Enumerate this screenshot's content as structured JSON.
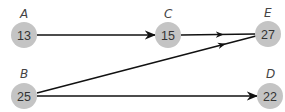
{
  "diagram": {
    "type": "directed-graph",
    "node_fill": "#c4c4c4",
    "edge_color": "#111111",
    "nodes": [
      {
        "id": "A",
        "label": "A",
        "value": "13",
        "x": 24,
        "y": 35
      },
      {
        "id": "C",
        "label": "C",
        "value": "15",
        "x": 168,
        "y": 35
      },
      {
        "id": "E",
        "label": "E",
        "value": "27",
        "x": 268,
        "y": 34
      },
      {
        "id": "B",
        "label": "B",
        "value": "25",
        "x": 24,
        "y": 96
      },
      {
        "id": "D",
        "label": "D",
        "value": "22",
        "x": 270,
        "y": 96
      }
    ],
    "edges": [
      {
        "from": "A",
        "to": "C"
      },
      {
        "from": "C",
        "to": "E"
      },
      {
        "from": "B",
        "to": "E"
      },
      {
        "from": "B",
        "to": "D"
      }
    ]
  }
}
